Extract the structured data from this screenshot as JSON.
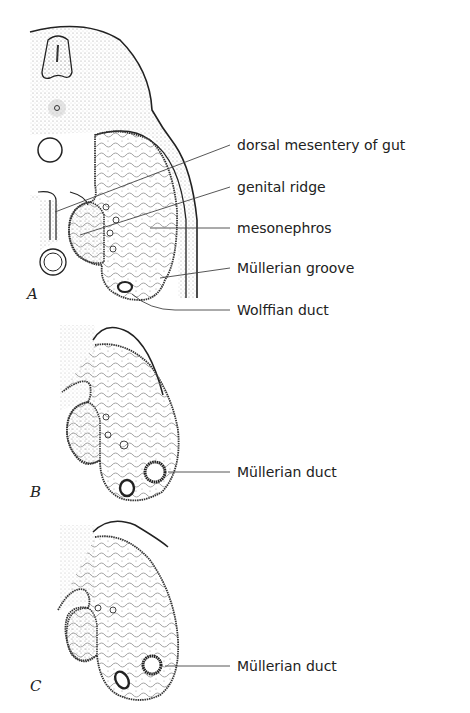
{
  "figure": {
    "panels": [
      {
        "letter": "A",
        "labels": [
          "dorsal mesentery of gut",
          "genital ridge",
          "mesonephros",
          "Müllerian groove",
          "Wolffian duct"
        ]
      },
      {
        "letter": "B",
        "labels": [
          "Müllerian duct"
        ]
      },
      {
        "letter": "C",
        "labels": [
          "Müllerian duct"
        ]
      }
    ]
  },
  "colors": {
    "ink": "#222222",
    "stipple": "#bdbdbd",
    "background": "#ffffff"
  }
}
